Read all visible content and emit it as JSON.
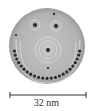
{
  "figure": {
    "scale_bar": {
      "label": "32 nm"
    },
    "colors": {
      "background": "#b4b4b4",
      "ring_light": "#d2d2d2",
      "dot": "#2a2a2a"
    }
  }
}
